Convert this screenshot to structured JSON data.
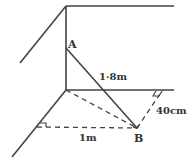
{
  "diagram": {
    "type": "geometry-3d-wall-corner",
    "colors": {
      "line": "#444444",
      "text": "#333333",
      "background": "#ffffff"
    },
    "points": {
      "A": {
        "label": "A"
      },
      "B": {
        "label": "B"
      }
    },
    "measurements": {
      "AB": "1·8m",
      "B_to_wall": "40cm",
      "B_to_other_wall": "1m"
    }
  }
}
